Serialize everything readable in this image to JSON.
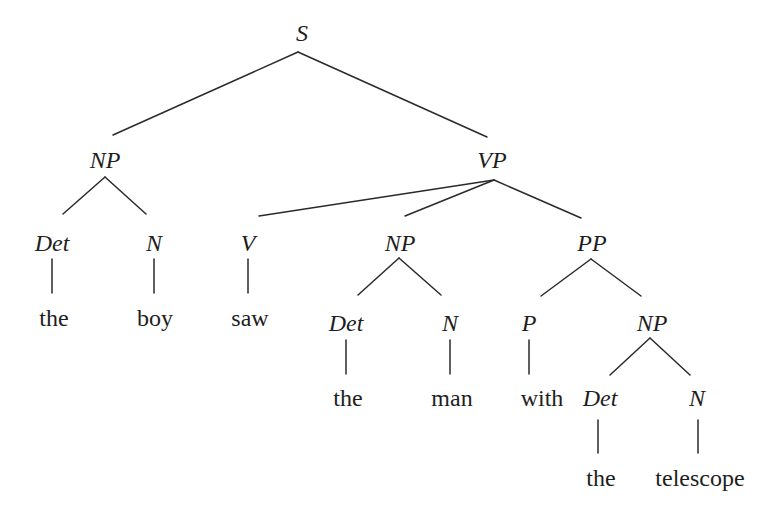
{
  "diagram": {
    "type": "syntax-tree",
    "sentence": "the boy saw the man with the telescope",
    "nodes": {
      "s": {
        "label": "S",
        "x": 302,
        "y": 33
      },
      "np_subj": {
        "label": "NP",
        "x": 105,
        "y": 160
      },
      "vp": {
        "label": "VP",
        "x": 492,
        "y": 160
      },
      "det_1": {
        "label": "Det",
        "x": 52,
        "y": 243
      },
      "n_1": {
        "label": "N",
        "x": 154,
        "y": 243
      },
      "v": {
        "label": "V",
        "x": 248,
        "y": 243
      },
      "np_obj": {
        "label": "NP",
        "x": 400,
        "y": 243
      },
      "pp": {
        "label": "PP",
        "x": 592,
        "y": 243
      },
      "w_the_1": {
        "label": "the",
        "x": 54,
        "y": 318
      },
      "w_boy": {
        "label": "boy",
        "x": 155,
        "y": 318
      },
      "w_saw": {
        "label": "saw",
        "x": 250,
        "y": 318
      },
      "det_2": {
        "label": "Det",
        "x": 346,
        "y": 323
      },
      "n_2": {
        "label": "N",
        "x": 450,
        "y": 323
      },
      "p": {
        "label": "P",
        "x": 529,
        "y": 323
      },
      "np_pobj": {
        "label": "NP",
        "x": 652,
        "y": 323
      },
      "w_the_2": {
        "label": "the",
        "x": 348,
        "y": 398
      },
      "w_man": {
        "label": "man",
        "x": 452,
        "y": 398
      },
      "w_with": {
        "label": "with",
        "x": 542,
        "y": 398
      },
      "det_3": {
        "label": "Det",
        "x": 600,
        "y": 398
      },
      "n_3": {
        "label": "N",
        "x": 697,
        "y": 398
      },
      "w_the_3": {
        "label": "the",
        "x": 601,
        "y": 478
      },
      "w_telescope": {
        "label": "telescope",
        "x": 700,
        "y": 478
      }
    },
    "edges": [
      {
        "from": "s",
        "to": "np_subj",
        "x1": 298,
        "y1": 52,
        "x2": 113,
        "y2": 135
      },
      {
        "from": "s",
        "to": "vp",
        "x1": 298,
        "y1": 52,
        "x2": 487,
        "y2": 137
      },
      {
        "from": "np_subj",
        "to": "det_1",
        "x1": 105,
        "y1": 177,
        "x2": 63,
        "y2": 214
      },
      {
        "from": "np_subj",
        "to": "n_1",
        "x1": 105,
        "y1": 177,
        "x2": 146,
        "y2": 214
      },
      {
        "from": "vp",
        "to": "v",
        "x1": 494,
        "y1": 180,
        "x2": 259,
        "y2": 216
      },
      {
        "from": "vp",
        "to": "np_obj",
        "x1": 494,
        "y1": 180,
        "x2": 405,
        "y2": 216
      },
      {
        "from": "vp",
        "to": "pp",
        "x1": 494,
        "y1": 180,
        "x2": 581,
        "y2": 218
      },
      {
        "from": "det_1",
        "to": "w_the_1",
        "x1": 52,
        "y1": 259,
        "x2": 52,
        "y2": 293
      },
      {
        "from": "n_1",
        "to": "w_boy",
        "x1": 154,
        "y1": 259,
        "x2": 154,
        "y2": 293
      },
      {
        "from": "v",
        "to": "w_saw",
        "x1": 248,
        "y1": 259,
        "x2": 248,
        "y2": 293
      },
      {
        "from": "np_obj",
        "to": "det_2",
        "x1": 399,
        "y1": 258,
        "x2": 358,
        "y2": 295
      },
      {
        "from": "np_obj",
        "to": "n_2",
        "x1": 399,
        "y1": 258,
        "x2": 441,
        "y2": 295
      },
      {
        "from": "pp",
        "to": "p",
        "x1": 591,
        "y1": 259,
        "x2": 541,
        "y2": 296
      },
      {
        "from": "pp",
        "to": "np_pobj",
        "x1": 591,
        "y1": 259,
        "x2": 641,
        "y2": 296
      },
      {
        "from": "det_2",
        "to": "w_the_2",
        "x1": 346,
        "y1": 340,
        "x2": 346,
        "y2": 374
      },
      {
        "from": "n_2",
        "to": "w_man",
        "x1": 450,
        "y1": 340,
        "x2": 450,
        "y2": 374
      },
      {
        "from": "p",
        "to": "w_with",
        "x1": 529,
        "y1": 340,
        "x2": 529,
        "y2": 374
      },
      {
        "from": "np_pobj",
        "to": "det_3",
        "x1": 650,
        "y1": 338,
        "x2": 610,
        "y2": 375
      },
      {
        "from": "np_pobj",
        "to": "n_3",
        "x1": 650,
        "y1": 338,
        "x2": 690,
        "y2": 375
      },
      {
        "from": "det_3",
        "to": "w_the_3",
        "x1": 598,
        "y1": 420,
        "x2": 598,
        "y2": 453
      },
      {
        "from": "n_3",
        "to": "w_telescope",
        "x1": 698,
        "y1": 420,
        "x2": 698,
        "y2": 453
      }
    ]
  }
}
